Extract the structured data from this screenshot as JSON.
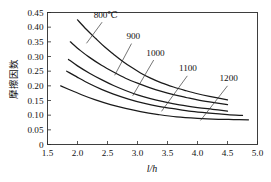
{
  "chart_data": {
    "type": "line",
    "title": "",
    "subtitle": "",
    "xlabel": "l/h",
    "ylabel": "摩擦因数",
    "xlim": [
      1.5,
      5.0
    ],
    "ylim": [
      0,
      0.45
    ],
    "grid": false,
    "legend_position": "inline-annotations",
    "x_ticks": [
      "1.5",
      "2.0",
      "2.5",
      "3.0",
      "3.5",
      "4.0",
      "4.5",
      "5.0"
    ],
    "x_tick_values": [
      1.5,
      2.0,
      2.5,
      3.0,
      3.5,
      4.0,
      4.5,
      5.0
    ],
    "y_ticks": [
      "0",
      "0.05",
      "0.10",
      "0.15",
      "0.20",
      "0.25",
      "0.30",
      "0.35",
      "0.40",
      "0.45"
    ],
    "y_tick_values": [
      0,
      0.05,
      0.1,
      0.15,
      0.2,
      0.25,
      0.3,
      0.35,
      0.4,
      0.45
    ],
    "series": [
      {
        "name": "800℃",
        "label": "800℃",
        "label_pos": {
          "x": 2.47,
          "y": 0.432
        },
        "leader": [
          [
            2.41,
            0.417
          ],
          [
            2.15,
            0.345
          ]
        ],
        "x": [
          2.0,
          2.15,
          2.3,
          2.45,
          2.6,
          2.75,
          2.9,
          3.05,
          3.2,
          3.4,
          3.6,
          3.8,
          4.0,
          4.2,
          4.5
        ],
        "values": [
          0.425,
          0.392,
          0.362,
          0.333,
          0.308,
          0.284,
          0.263,
          0.244,
          0.228,
          0.21,
          0.196,
          0.184,
          0.173,
          0.164,
          0.152
        ]
      },
      {
        "name": "900",
        "label": "900",
        "label_pos": {
          "x": 2.93,
          "y": 0.359
        },
        "leader": [
          [
            2.9,
            0.344
          ],
          [
            2.62,
            0.236
          ]
        ],
        "x": [
          1.88,
          2.05,
          2.2,
          2.4,
          2.6,
          2.8,
          3.0,
          3.2,
          3.4,
          3.6,
          3.8,
          4.0,
          4.2,
          4.5
        ],
        "values": [
          0.35,
          0.32,
          0.297,
          0.27,
          0.247,
          0.226,
          0.209,
          0.194,
          0.181,
          0.17,
          0.161,
          0.152,
          0.145,
          0.136
        ]
      },
      {
        "name": "1000",
        "label": "1000",
        "label_pos": {
          "x": 3.3,
          "y": 0.303
        },
        "leader": [
          [
            3.27,
            0.288
          ],
          [
            2.92,
            0.166
          ]
        ],
        "x": [
          1.85,
          2.0,
          2.2,
          2.4,
          2.6,
          2.8,
          3.0,
          3.2,
          3.45,
          3.7,
          4.0,
          4.25,
          4.5
        ],
        "values": [
          0.29,
          0.268,
          0.243,
          0.221,
          0.201,
          0.184,
          0.169,
          0.157,
          0.145,
          0.135,
          0.126,
          0.12,
          0.114
        ]
      },
      {
        "name": "1100",
        "label": "1100",
        "label_pos": {
          "x": 3.84,
          "y": 0.249
        },
        "leader": [
          [
            3.83,
            0.234
          ],
          [
            3.4,
            0.113
          ]
        ],
        "x": [
          1.82,
          2.0,
          2.2,
          2.4,
          2.6,
          2.85,
          3.1,
          3.35,
          3.6,
          3.9,
          4.2,
          4.5,
          4.75
        ],
        "values": [
          0.25,
          0.229,
          0.207,
          0.188,
          0.172,
          0.155,
          0.141,
          0.13,
          0.122,
          0.113,
          0.107,
          0.102,
          0.099
        ]
      },
      {
        "name": "1200",
        "label": "1200",
        "label_pos": {
          "x": 4.52,
          "y": 0.215
        },
        "leader": [
          [
            4.5,
            0.2
          ],
          [
            4.05,
            0.082
          ]
        ],
        "x": [
          1.72,
          1.9,
          2.1,
          2.3,
          2.55,
          2.8,
          3.05,
          3.35,
          3.65,
          4.0,
          4.35,
          4.6,
          4.85
        ],
        "values": [
          0.2,
          0.184,
          0.167,
          0.152,
          0.136,
          0.123,
          0.112,
          0.102,
          0.094,
          0.089,
          0.086,
          0.085,
          0.084
        ]
      }
    ]
  },
  "figure": {
    "background": "#ffffff",
    "line_color": "#1a1a1a",
    "axis_color": "#2a2a2a",
    "text_color": "#111111"
  }
}
